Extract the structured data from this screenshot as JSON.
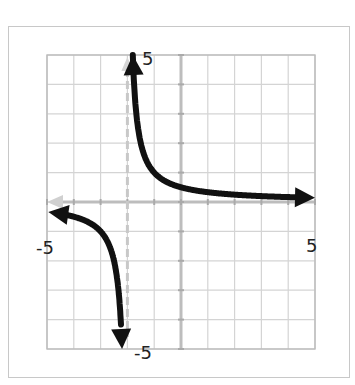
{
  "chart_data": {
    "type": "line",
    "title": "",
    "xlabel": "",
    "ylabel": "",
    "xlim": [
      -5,
      5
    ],
    "ylim": [
      -5,
      5
    ],
    "grid": true,
    "grid_step": 1,
    "tick_labels": {
      "x_min": "-5",
      "x_max": "5",
      "y_min": "-5",
      "y_max": "5"
    },
    "asymptotes": {
      "vertical": -2,
      "horizontal": 0
    },
    "function": "y = 1/(x+2)",
    "series": [
      {
        "name": "right-branch",
        "x": [
          -1.8,
          -1.5,
          -1,
          -0.5,
          0,
          1,
          2,
          3,
          4,
          5
        ],
        "y": [
          5,
          2,
          1,
          0.67,
          0.5,
          0.33,
          0.25,
          0.2,
          0.17,
          0.14
        ]
      },
      {
        "name": "left-branch",
        "x": [
          -5,
          -4,
          -3,
          -2.5,
          -2.2
        ],
        "y": [
          -0.33,
          -0.5,
          -1,
          -2,
          -5
        ]
      }
    ],
    "colors": {
      "curve": "#111111",
      "axes": "#bdbdbd",
      "grid": "#d4d4d4",
      "asymptote": "#c8c8c8"
    }
  }
}
